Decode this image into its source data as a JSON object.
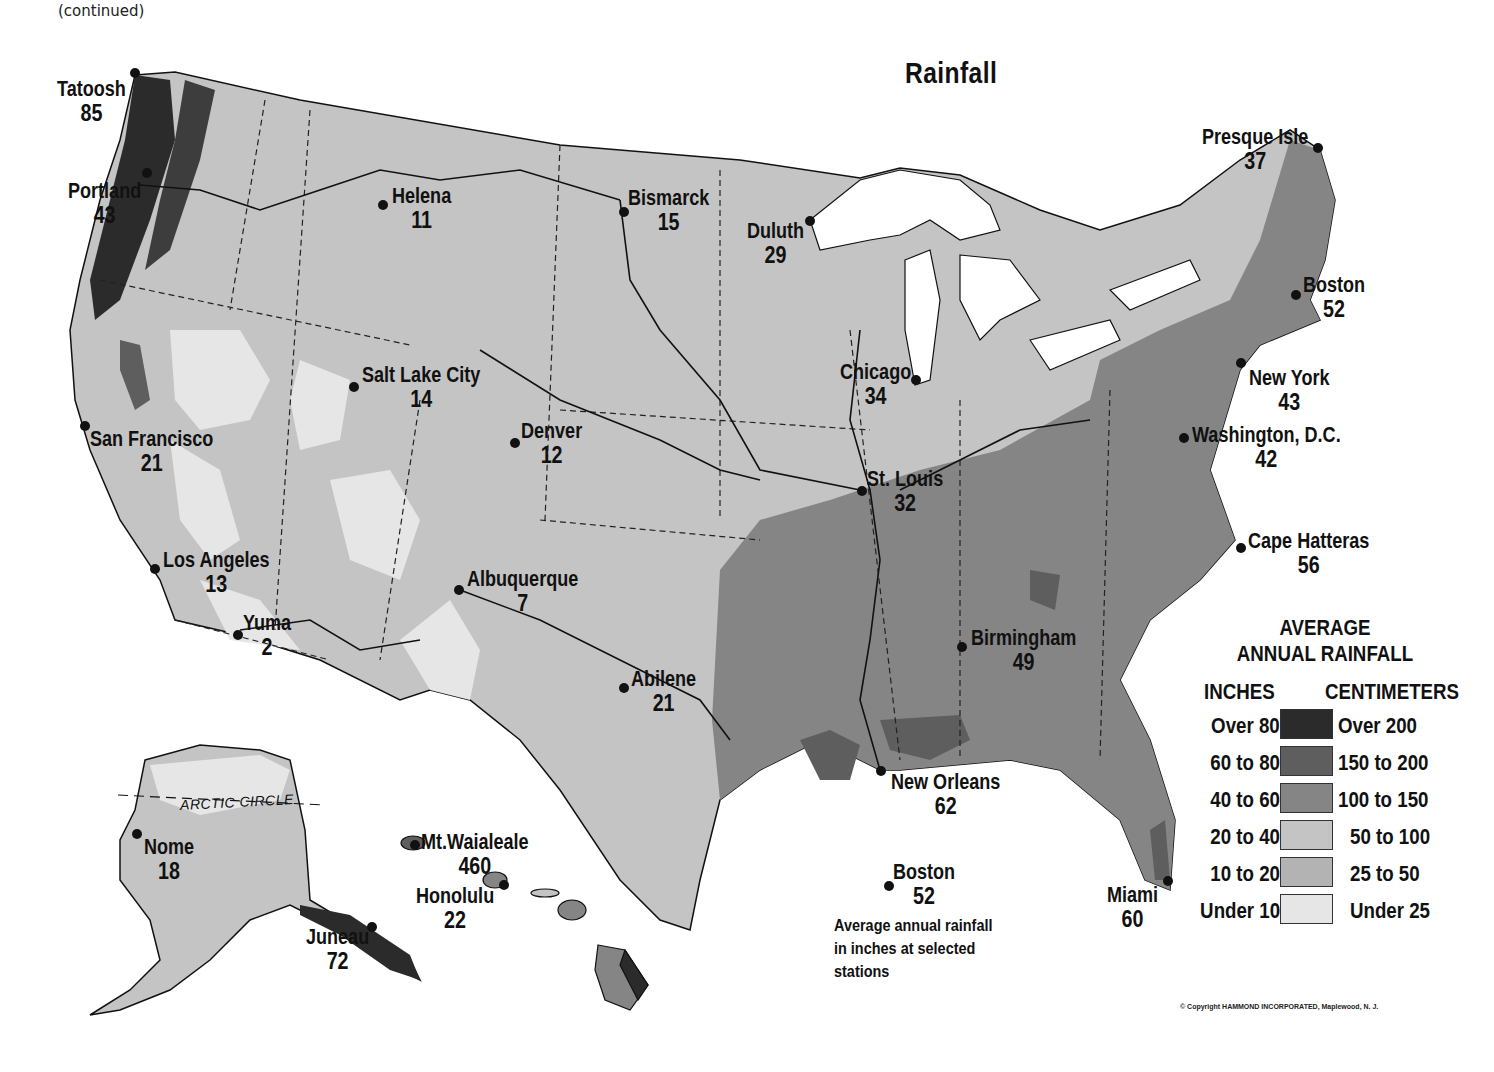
{
  "header": {
    "continued_label": "(continued)",
    "title": "Rainfall"
  },
  "legend": {
    "title_line1": "AVERAGE",
    "title_line2": "ANNUAL RAINFALL",
    "inches_header": "INCHES",
    "centimeters_header": "CENTIMETERS",
    "rows": [
      {
        "inches": "Over 80",
        "centimeters": "Over 200",
        "color": "#2b2b2b"
      },
      {
        "inches": "60 to 80",
        "centimeters": "150 to 200",
        "color": "#5e5e5e"
      },
      {
        "inches": "40 to 60",
        "centimeters": "100 to 150",
        "color": "#858585"
      },
      {
        "inches": "20 to 40",
        "centimeters": "50 to 100",
        "color": "#c4c4c4"
      },
      {
        "inches": "10 to 20",
        "centimeters": "25 to 50",
        "color": "#b3b3b3"
      },
      {
        "inches": "Under 10",
        "centimeters": "Under 25",
        "color": "#e6e6e6"
      }
    ]
  },
  "key_example": {
    "name": "Boston",
    "value": "52",
    "note_line1": "Average annual rainfall",
    "note_line2": "in inches at selected",
    "note_line3": "stations"
  },
  "stations": [
    {
      "name": "Tatoosh",
      "value": "85"
    },
    {
      "name": "Portland",
      "value": "43"
    },
    {
      "name": "Helena",
      "value": "11"
    },
    {
      "name": "Bismarck",
      "value": "15"
    },
    {
      "name": "Duluth",
      "value": "29"
    },
    {
      "name": "Presque Isle",
      "value": "37"
    },
    {
      "name": "Boston",
      "value": "52"
    },
    {
      "name": "New York",
      "value": "43"
    },
    {
      "name": "Washington, D.C.",
      "value": "42"
    },
    {
      "name": "Chicago",
      "value": "34"
    },
    {
      "name": "Salt Lake City",
      "value": "14"
    },
    {
      "name": "San Francisco",
      "value": "21"
    },
    {
      "name": "Denver",
      "value": "12"
    },
    {
      "name": "St. Louis",
      "value": "32"
    },
    {
      "name": "Cape Hatteras",
      "value": "56"
    },
    {
      "name": "Los Angeles",
      "value": "13"
    },
    {
      "name": "Yuma",
      "value": "2"
    },
    {
      "name": "Albuquerque",
      "value": "7"
    },
    {
      "name": "Abilene",
      "value": "21"
    },
    {
      "name": "Birmingham",
      "value": "49"
    },
    {
      "name": "New Orleans",
      "value": "62"
    },
    {
      "name": "Miami",
      "value": "60"
    },
    {
      "name": "Nome",
      "value": "18"
    },
    {
      "name": "Juneau",
      "value": "72"
    },
    {
      "name": "Mt.Waialeale",
      "value": "460"
    },
    {
      "name": "Honolulu",
      "value": "22"
    }
  ],
  "annotations": {
    "arctic_circle": "ARCTIC CIRCLE"
  },
  "footer": {
    "copyright": "© Copyright HAMMOND INCORPORATED, Maplewood, N. J."
  }
}
